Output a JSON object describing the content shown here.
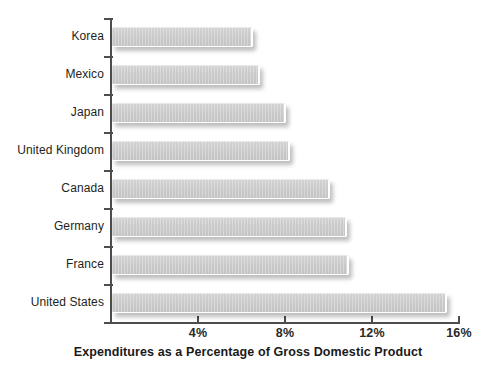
{
  "chart_data": {
    "type": "bar",
    "orientation": "horizontal",
    "title": "Expenditures as a Percentage of Gross Domestic Product",
    "xlabel": "Expenditures as a Percentage of Gross Domestic Product",
    "ylabel": "",
    "categories": [
      "Korea",
      "Mexico",
      "Japan",
      "United Kingdom",
      "Canada",
      "Germany",
      "France",
      "United States"
    ],
    "values": [
      6.5,
      6.8,
      8.0,
      8.2,
      10.0,
      10.8,
      10.9,
      15.4
    ],
    "xlim": [
      0,
      16
    ],
    "xticks": [
      4,
      8,
      12,
      16
    ],
    "xtick_labels": [
      "4%",
      "8%",
      "12%",
      "16%"
    ],
    "grid": false,
    "legend": false,
    "bar_color": "#cacaca",
    "axis_color": "#4d4d4d",
    "text_color": "#231f20"
  },
  "axis": {
    "x_origin_value": 0,
    "x_max_value": 16,
    "px_per_unit": 21.75,
    "plot_left_px": 110,
    "plot_bottom_px": 322,
    "bar_height_px": 20,
    "bar_pitch_px": 38,
    "first_bar_top_px": 27
  }
}
